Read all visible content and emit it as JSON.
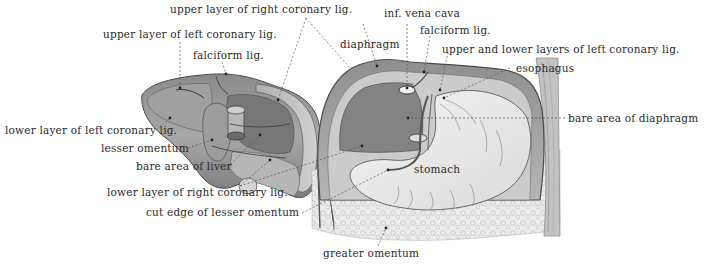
{
  "figure": {
    "colors": {
      "background": "#ffffff",
      "label_text": "#2a2a2a",
      "leader_line": "#555555",
      "liver_fill": "#9a9a9a",
      "liver_dark": "#5e5e5e",
      "liver_light": "#c4c4c4",
      "stomach_fill": "#ececec",
      "omentum_fill": "#e2e2e2",
      "diaphragm_dark": "#6a6a6a"
    },
    "labels": {
      "upper_right_coronary": "upper layer of right coronary lig.",
      "upper_left_coronary": "upper layer of left coronary lig.",
      "falciform_liver": "falciform lig.",
      "diaphragm": "diaphragm",
      "inf_vena_cava": "inf. vena cava",
      "falciform_diaphragm": "falciform lig.",
      "upper_lower_left_coronary": "upper and lower layers of left coronary lig.",
      "esophagus": "esophagus",
      "bare_area_diaphragm": "bare area of diaphragm",
      "lower_left_coronary": "lower layer of left coronary lig.",
      "lesser_omentum": "lesser omentum",
      "bare_area_liver": "bare area of liver",
      "stomach": "stomach",
      "lower_right_coronary": "lower layer of right coronary lig.",
      "cut_edge_lesser_omentum": "cut edge of lesser omentum",
      "greater_omentum": "greater omentum"
    }
  }
}
